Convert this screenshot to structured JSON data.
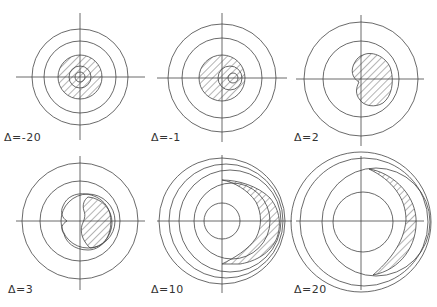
{
  "figure": {
    "panels": [
      {
        "label": "Δ=-20",
        "delta": -20
      },
      {
        "label": "Δ=-1",
        "delta": -1
      },
      {
        "label": "Δ=2",
        "delta": 2
      },
      {
        "label": "Δ=3",
        "delta": 3
      },
      {
        "label": "Δ=10",
        "delta": 10
      },
      {
        "label": "Δ=20",
        "delta": 20
      }
    ]
  },
  "colors": {
    "line": "#444444",
    "background": "#ffffff"
  }
}
